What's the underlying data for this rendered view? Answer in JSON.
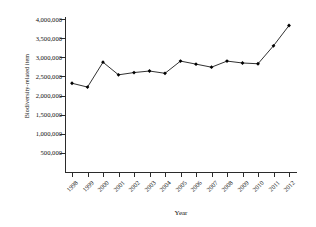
{
  "chart_data": {
    "type": "line",
    "title": "",
    "xlabel": "Year",
    "ylabel": "Biodiversity-related item",
    "categories": [
      "1998",
      "1999",
      "2000",
      "2001",
      "2002",
      "2003",
      "2004",
      "2005",
      "2006",
      "2007",
      "2008",
      "2009",
      "2010",
      "2011",
      "2012"
    ],
    "x": [
      1998,
      1999,
      2000,
      2001,
      2002,
      2003,
      2004,
      2005,
      2006,
      2007,
      2008,
      2009,
      2010,
      2011,
      2012
    ],
    "values": [
      2320000,
      2220000,
      2870000,
      2540000,
      2600000,
      2640000,
      2580000,
      2900000,
      2820000,
      2740000,
      2900000,
      2850000,
      2830000,
      3300000,
      3830000
    ],
    "ylim": [
      0,
      4000000
    ],
    "yticks": [
      500000,
      1000000,
      1500000,
      2000000,
      2500000,
      3000000,
      3500000,
      4000000
    ],
    "ytick_labels": [
      "500,000",
      "1,000,000",
      "1,500,000",
      "2,000,000",
      "2,500,000",
      "3,000,000",
      "3,500,000",
      "4,000,000"
    ],
    "grid": false,
    "legend": "none",
    "marker": "filled-diamond",
    "line_color": "#1a1a1a",
    "marker_color": "#000000"
  }
}
